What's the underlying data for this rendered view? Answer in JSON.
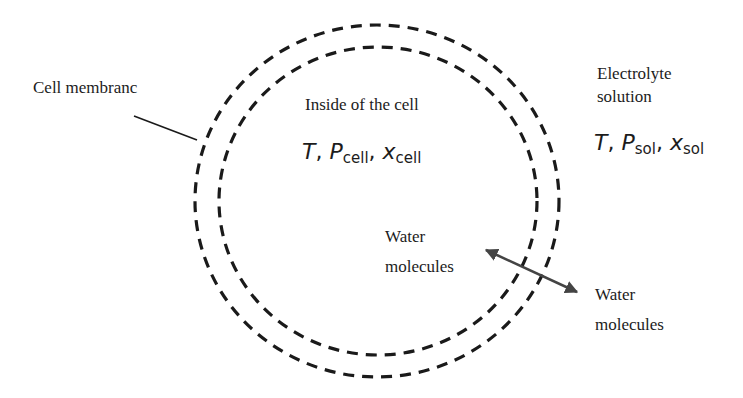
{
  "diagram": {
    "labels": {
      "cell_membrane": "Cell membranc",
      "inside_cell": "Inside of the cell",
      "electrolyte_line1": "Electrolyte",
      "electrolyte_line2": "solution",
      "water_inside_line1": "Water",
      "water_inside_line2": "molecules",
      "water_outside_line1": "Water",
      "water_outside_line2": "molecules"
    },
    "cell_variables": {
      "T": "T",
      "sep1": ", ",
      "P": "P",
      "P_sub": "cell",
      "sep2": ", ",
      "x": "x",
      "x_sub": "cell"
    },
    "solution_variables": {
      "T": "T",
      "sep1": ", ",
      "P": "P",
      "P_sub": "sol",
      "sep2": ", ",
      "x": "x",
      "x_sub": "sol"
    },
    "colors": {
      "membrane_dashes": "#1a1a1a",
      "arrow": "#444444",
      "text": "#1c1c1c",
      "background": "#ffffff"
    }
  }
}
